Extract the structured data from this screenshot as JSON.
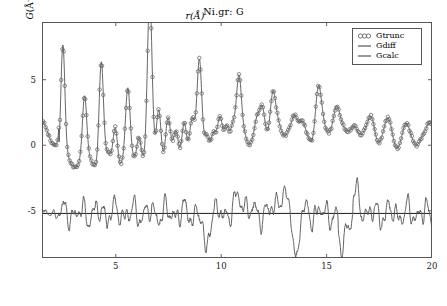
{
  "chart_data": {
    "type": "line",
    "title": "Ni.gr: G",
    "xlabel": "r(Å)",
    "ylabel_symbol": "G",
    "ylabel_unit": "(Å⁻²)",
    "xlim": [
      1.5,
      20.0
    ],
    "ylim": [
      -8.6,
      9.4
    ],
    "xticks": [
      5,
      10,
      15,
      20
    ],
    "xtick_labels": [
      "5",
      "10",
      "15",
      "20"
    ],
    "yticks": [
      5,
      0,
      -5
    ],
    "ytick_labels": [
      "5",
      "0",
      "-5"
    ],
    "grid": false,
    "legend_position": "upper right",
    "baseline_offset": -5.2,
    "marker_style": "open-circle",
    "line_color": "#555555",
    "marker_color": "#666666",
    "baseline_color": "#000000",
    "frame_color": "#555555",
    "series": [
      {
        "name": "Gtrunc",
        "style": "markers",
        "marker": "o",
        "note": "Truncated experimental PDF data, open circles overlaid on Gcalc"
      },
      {
        "name": "Gdiff",
        "style": "line",
        "note": "Difference curve Gtrunc - Gcalc, offset vertically to baseline -5.2"
      },
      {
        "name": "Gcalc",
        "style": "line",
        "note": "Calculated / refined model PDF curve"
      }
    ],
    "peaks_r": [
      2.49,
      3.52,
      4.31,
      4.98,
      5.57,
      6.1,
      6.61,
      7.04,
      7.47,
      7.87,
      8.24,
      8.62,
      8.97,
      9.3,
      9.63,
      9.95,
      10.25,
      10.55,
      10.85,
      11.13,
      11.4,
      11.68,
      11.95,
      12.2,
      12.45,
      12.7,
      12.95,
      13.2,
      13.45,
      13.68,
      13.9,
      14.15,
      14.38,
      14.6,
      14.82,
      15.05,
      15.27,
      15.48,
      15.7,
      15.9,
      16.12,
      16.33,
      16.53,
      16.75,
      16.95,
      17.15,
      17.35,
      17.55,
      17.75,
      17.95,
      18.15,
      18.35,
      18.55,
      18.75,
      18.95,
      19.15,
      19.35,
      19.55,
      19.75,
      19.95
    ],
    "peak_heights": [
      8.3,
      4.4,
      7.6,
      2.9,
      5.0,
      2.3,
      12.0,
      4.3,
      3.0,
      2.1,
      3.3,
      2.6,
      7.8,
      2.2,
      1.5,
      3.2,
      3.0,
      2.2,
      5.9,
      2.0,
      1.2,
      2.3,
      3.6,
      1.6,
      4.9,
      1.8,
      1.1,
      2.2,
      3.0,
      1.3,
      1.9,
      1.5,
      1.0,
      4.7,
      1.6,
      1.2,
      1.9,
      3.4,
      1.3,
      0.9,
      1.5,
      2.2,
      1.1,
      0.8,
      1.2,
      2.6,
      1.0,
      0.7,
      1.1,
      1.9,
      0.9,
      0.6,
      1.0,
      1.6,
      0.8,
      0.6,
      0.9,
      1.4,
      0.7,
      2.0
    ]
  },
  "legend": {
    "entries": [
      {
        "label": "Gtrunc",
        "icon": "circle-marker-icon"
      },
      {
        "label": "Gdiff",
        "icon": "line-marker-icon"
      },
      {
        "label": "Gcalc",
        "icon": "line-marker-icon"
      }
    ]
  }
}
